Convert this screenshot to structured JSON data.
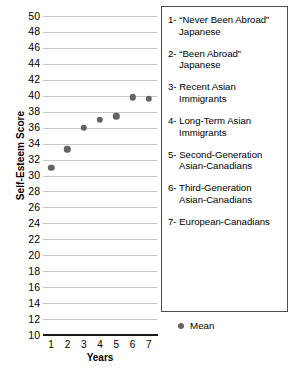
{
  "chart_data": {
    "type": "scatter",
    "title": "",
    "xlabel": "Years",
    "ylabel": "Self-Esteem Score",
    "xlim": [
      0.5,
      7.5
    ],
    "ylim": [
      10,
      50
    ],
    "grid": "horizontal",
    "x": [
      1,
      2,
      3,
      4,
      5,
      6,
      7
    ],
    "values": [
      31.0,
      33.3,
      36.0,
      37.0,
      37.4,
      39.8,
      39.6
    ],
    "series": [
      {
        "name": "Mean",
        "marker": "circle",
        "color": "#636363",
        "values": [
          31.0,
          33.3,
          36.0,
          37.0,
          37.4,
          39.8,
          39.6
        ]
      }
    ],
    "xticks": [
      "1",
      "2",
      "3",
      "4",
      "5",
      "6",
      "7"
    ],
    "yticks": [
      "10",
      "12",
      "14",
      "16",
      "18",
      "20",
      "22",
      "24",
      "26",
      "28",
      "30",
      "32",
      "34",
      "36",
      "38",
      "40",
      "42",
      "44",
      "46",
      "48",
      "50"
    ],
    "legend_position": "right",
    "legend_entries": [
      "1- “Never Been Abroad”\nJapanese",
      "2- “Been Abroad”\nJapanese",
      "3- Recent Asian\nImmigrants",
      "4- Long-Term Asian\nImmigrants",
      "5- Second-Generation\nAsian-Canadians",
      "6- Third-Generation\nAsian-Canadians",
      "7- European-Canadians"
    ],
    "marker_legend_label": "Mean",
    "colors": {
      "marker": "#636363",
      "gridline": "#c8c8c8",
      "axis": "#1a1a1a",
      "legend_border": "#4d4d4d",
      "background": "#ffffff"
    }
  }
}
